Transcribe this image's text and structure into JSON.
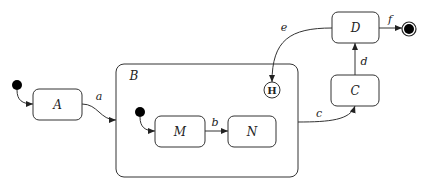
{
  "diagram": {
    "type": "UML state machine",
    "states": {
      "A": {
        "label": "A"
      },
      "B": {
        "label": "B",
        "composite": true
      },
      "M": {
        "label": "M"
      },
      "N": {
        "label": "N"
      },
      "C": {
        "label": "C"
      },
      "D": {
        "label": "D"
      }
    },
    "history": {
      "label": "H"
    },
    "transitions": {
      "a": {
        "label": "a",
        "from": "A",
        "to": "B"
      },
      "b": {
        "label": "b",
        "from": "M",
        "to": "N"
      },
      "c": {
        "label": "c",
        "from": "B",
        "to": "C"
      },
      "d": {
        "label": "d",
        "from": "C",
        "to": "D"
      },
      "e": {
        "label": "e",
        "from": "D",
        "to": "H"
      },
      "f": {
        "label": "f",
        "from": "D",
        "to": "final"
      }
    },
    "colors": {
      "stroke": "#333333",
      "fill": "#ffffff",
      "node": "#000000"
    }
  }
}
